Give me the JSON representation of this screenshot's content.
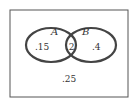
{
  "diagram": {
    "type": "venn",
    "sets": [
      {
        "name": "A",
        "only_value": ".15"
      },
      {
        "name": "B",
        "only_value": ".4"
      }
    ],
    "intersection_value": ".2",
    "outside_value": ".25",
    "colors": {
      "stroke": "#444444",
      "background": "#ffffff"
    }
  }
}
